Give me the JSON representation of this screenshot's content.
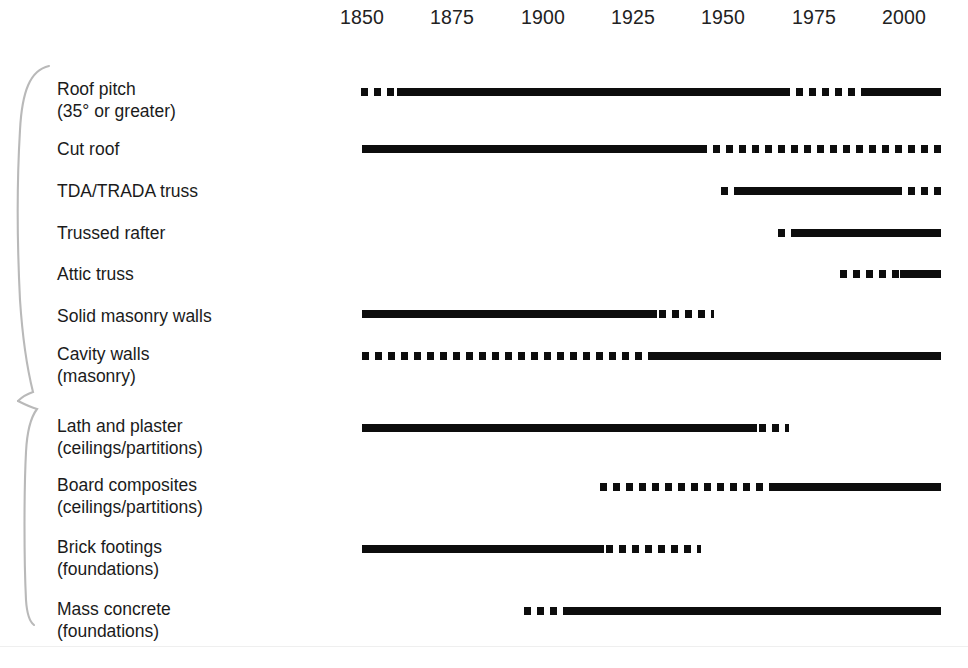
{
  "axis": {
    "ticks": [
      {
        "label": "1850",
        "x": 362
      },
      {
        "label": "1875",
        "x": 452
      },
      {
        "label": "1900",
        "x": 543
      },
      {
        "label": "1925",
        "x": 633
      },
      {
        "label": "1950",
        "x": 723
      },
      {
        "label": "1975",
        "x": 814
      },
      {
        "label": "2000",
        "x": 904
      }
    ]
  },
  "braces": {
    "upper_label": "superstructure-group-brace",
    "lower_label": "internal-and-foundations-group-brace"
  },
  "chart_data": {
    "type": "table",
    "subtype": "timeline-gantt",
    "title": "",
    "xlabel": "",
    "ylabel": "",
    "xlim": [
      1850,
      2000
    ],
    "x_tick_labels": [
      "1850",
      "1875",
      "1900",
      "1925",
      "1950",
      "1975",
      "2000"
    ],
    "x_tick_step": 25,
    "grid": false,
    "legend": {
      "position": "none",
      "entries": [
        {
          "style": "solid",
          "meaning": "period of common / widespread use"
        },
        {
          "style": "dashed",
          "meaning": "period of limited or transitional use"
        }
      ]
    },
    "axis_pixel_mapping": {
      "year_1850_x": 362,
      "year_2000_x": 904,
      "px_per_year": 3.613
    },
    "rows": [
      {
        "label_line1": "Roof pitch",
        "label_line2": "(35° or greater)",
        "label_y": 78,
        "bar_y": 88,
        "segments": [
          {
            "style": "dashed",
            "x1": 361,
            "x2": 397,
            "start_year": 1850,
            "end_year": 1860
          },
          {
            "style": "solid",
            "x1": 397,
            "x2": 783,
            "start_year": 1860,
            "end_year": 1967
          },
          {
            "style": "dashed",
            "x1": 783,
            "x2": 865,
            "start_year": 1967,
            "end_year": 1989
          },
          {
            "style": "solid",
            "x1": 865,
            "x2": 941,
            "start_year": 1989,
            "end_year": 2010
          }
        ]
      },
      {
        "label_line1": "Cut roof",
        "label_line2": "",
        "label_y": 138,
        "bar_y": 145,
        "segments": [
          {
            "style": "solid",
            "x1": 362,
            "x2": 700,
            "start_year": 1850,
            "end_year": 1943
          },
          {
            "style": "dashed",
            "x1": 700,
            "x2": 941,
            "start_year": 1943,
            "end_year": 2010
          }
        ]
      },
      {
        "label_line1": "TDA/TRADA truss",
        "label_line2": "",
        "label_y": 180,
        "bar_y": 187,
        "segments": [
          {
            "style": "dashed",
            "x1": 721,
            "x2": 741,
            "start_year": 1949,
            "end_year": 1955
          },
          {
            "style": "solid",
            "x1": 741,
            "x2": 895,
            "start_year": 1955,
            "end_year": 1997
          },
          {
            "style": "dashed",
            "x1": 895,
            "x2": 941,
            "start_year": 1997,
            "end_year": 2010
          }
        ]
      },
      {
        "label_line1": "Trussed rafter",
        "label_line2": "",
        "label_y": 222,
        "bar_y": 229,
        "segments": [
          {
            "style": "dashed",
            "x1": 778,
            "x2": 796,
            "start_year": 1965,
            "end_year": 1970
          },
          {
            "style": "solid",
            "x1": 796,
            "x2": 941,
            "start_year": 1970,
            "end_year": 2010
          }
        ]
      },
      {
        "label_line1": "Attic truss",
        "label_line2": "",
        "label_y": 263,
        "bar_y": 270,
        "segments": [
          {
            "style": "dashed",
            "x1": 840,
            "x2": 900,
            "start_year": 1982,
            "end_year": 1999
          },
          {
            "style": "solid",
            "x1": 900,
            "x2": 941,
            "start_year": 1999,
            "end_year": 2010
          }
        ]
      },
      {
        "label_line1": "Solid masonry walls",
        "label_line2": "",
        "label_y": 305,
        "bar_y": 310,
        "segments": [
          {
            "style": "solid",
            "x1": 362,
            "x2": 657,
            "start_year": 1850,
            "end_year": 1932
          },
          {
            "style": "dashed",
            "x1": 659,
            "x2": 714,
            "start_year": 1932,
            "end_year": 1947
          }
        ]
      },
      {
        "label_line1": "Cavity walls",
        "label_line2": "(masonry)",
        "label_y": 343,
        "bar_y": 352,
        "segments": [
          {
            "style": "dashed",
            "x1": 362,
            "x2": 649,
            "start_year": 1850,
            "end_year": 1929
          },
          {
            "style": "solid",
            "x1": 649,
            "x2": 941,
            "start_year": 1929,
            "end_year": 2010
          }
        ]
      },
      {
        "label_line1": "Lath and plaster",
        "label_line2": "(ceilings/partitions)",
        "label_y": 415,
        "bar_y": 424,
        "segments": [
          {
            "style": "solid",
            "x1": 362,
            "x2": 757,
            "start_year": 1850,
            "end_year": 1959
          },
          {
            "style": "dashed",
            "x1": 759,
            "x2": 789,
            "start_year": 1959,
            "end_year": 1968
          }
        ]
      },
      {
        "label_line1": "Board composites",
        "label_line2": "(ceilings/partitions)",
        "label_y": 474,
        "bar_y": 483,
        "segments": [
          {
            "style": "dashed",
            "x1": 600,
            "x2": 773,
            "start_year": 1916,
            "end_year": 1964
          },
          {
            "style": "solid",
            "x1": 773,
            "x2": 941,
            "start_year": 1964,
            "end_year": 2010
          }
        ]
      },
      {
        "label_line1": "Brick footings",
        "label_line2": "(foundations)",
        "label_y": 536,
        "bar_y": 545,
        "segments": [
          {
            "style": "solid",
            "x1": 362,
            "x2": 604,
            "start_year": 1850,
            "end_year": 1917
          },
          {
            "style": "dashed",
            "x1": 606,
            "x2": 701,
            "start_year": 1917,
            "end_year": 1944
          }
        ]
      },
      {
        "label_line1": "Mass concrete",
        "label_line2": "(foundations)",
        "label_y": 598,
        "bar_y": 607,
        "segments": [
          {
            "style": "dashed",
            "x1": 524,
            "x2": 564,
            "start_year": 1895,
            "end_year": 1906
          },
          {
            "style": "solid",
            "x1": 564,
            "x2": 941,
            "start_year": 1906,
            "end_year": 2010
          }
        ]
      }
    ]
  }
}
